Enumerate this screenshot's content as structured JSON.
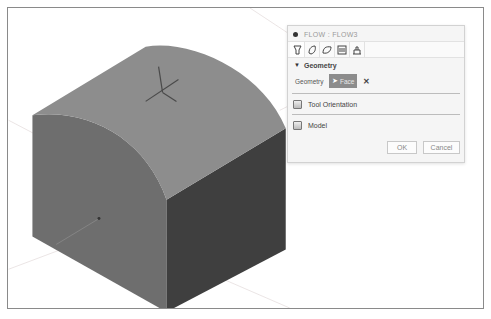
{
  "panel": {
    "title": "FLOW : FLOW3",
    "toolbar": [
      {
        "name": "tool-icon"
      },
      {
        "name": "surface-icon"
      },
      {
        "name": "face-icon"
      },
      {
        "name": "passes-icon"
      },
      {
        "name": "linking-icon"
      }
    ],
    "sections": {
      "geometry": {
        "header": "Geometry",
        "field_label": "Geometry",
        "selection": "Face",
        "clear_symbol": "✕"
      },
      "tool_orientation": {
        "label": "Tool Orientation"
      },
      "model": {
        "label": "Model"
      }
    },
    "buttons": {
      "ok": "OK",
      "cancel": "Cancel"
    }
  },
  "colors": {
    "top_face": "#8d8d8d",
    "front_face": "#6e6e6e",
    "right_face": "#3f3f3f",
    "selection_chip": "#8c8c8c"
  }
}
